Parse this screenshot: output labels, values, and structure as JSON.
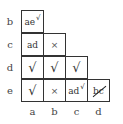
{
  "chart": {
    "type": "implication-table",
    "row_labels": [
      "b",
      "c",
      "d",
      "e"
    ],
    "col_labels": [
      "a",
      "b",
      "c",
      "d"
    ],
    "cells": {
      "b_a": {
        "text": "ae",
        "mark": "√"
      },
      "c_a": {
        "text": "ad",
        "mark": ""
      },
      "c_b": {
        "text": "×",
        "mark": ""
      },
      "d_a": {
        "text": "√",
        "mark": ""
      },
      "d_b": {
        "text": "√",
        "mark": ""
      },
      "d_c": {
        "text": "√",
        "mark": ""
      },
      "e_a": {
        "text": "√",
        "mark": ""
      },
      "e_b": {
        "text": "×",
        "mark": ""
      },
      "e_c": {
        "text": "ad",
        "mark": "√"
      },
      "e_d": {
        "text": "bc",
        "mark": "struck"
      }
    }
  }
}
